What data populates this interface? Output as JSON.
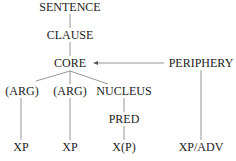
{
  "diagram": {
    "type": "tree",
    "nodes": {
      "sentence": "SENTENCE",
      "clause": "CLAUSE",
      "core": "CORE",
      "periphery": "PERIPHERY",
      "arg1": "(ARG)",
      "arg2": "(ARG)",
      "nucleus": "NUCLEUS",
      "pred": "PRED",
      "xp1": "XP",
      "xp2": "XP",
      "xp3": "X(P)",
      "xpadv": "XP/ADV"
    },
    "edges": [
      [
        "SENTENCE",
        "CLAUSE"
      ],
      [
        "CLAUSE",
        "CORE"
      ],
      [
        "CORE",
        "(ARG)"
      ],
      [
        "CORE",
        "(ARG)"
      ],
      [
        "CORE",
        "NUCLEUS"
      ],
      [
        "PERIPHERY",
        "CORE",
        "arrow"
      ],
      [
        "(ARG)",
        "XP"
      ],
      [
        "(ARG)",
        "XP"
      ],
      [
        "NUCLEUS",
        "PRED"
      ],
      [
        "PRED",
        "X(P)"
      ],
      [
        "PERIPHERY",
        "XP/ADV"
      ]
    ],
    "colors": {
      "text": "#1a1a1a",
      "line": "#8a8a8a"
    }
  }
}
